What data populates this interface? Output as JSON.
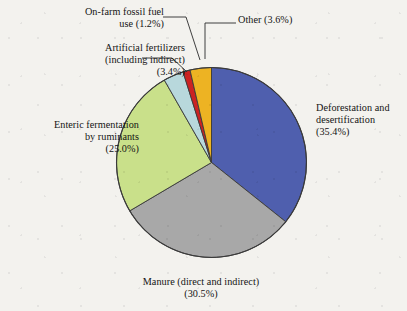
{
  "chart_data": {
    "type": "pie",
    "title": "",
    "subtitle": "",
    "xlabel": "",
    "ylabel": "",
    "units": "percent",
    "legend_position": "none",
    "grid": false,
    "start_angle_deg": 0,
    "direction": "clockwise",
    "categories": [
      "Deforestation and desertification",
      "Manure (direct and indirect)",
      "Enteric fermentation by ruminants",
      "Artificial fertilizers (including indirect)",
      "On-farm fossil fuel use",
      "Other"
    ],
    "values": [
      35.4,
      30.5,
      25.0,
      3.4,
      1.2,
      3.6
    ],
    "colors": [
      "#4f5fae",
      "#a8a8a8",
      "#c9e08a",
      "#b8d8dc",
      "#cc2222",
      "#edb323"
    ],
    "slices": [
      {
        "name": "deforestation",
        "label": "Deforestation and desertification",
        "value": 35.4,
        "value_text": "(35.4%)",
        "color": "#4f5fae"
      },
      {
        "name": "manure",
        "label": "Manure (direct and indirect)",
        "value": 30.5,
        "value_text": "(30.5%)",
        "color": "#a8a8a8"
      },
      {
        "name": "enteric-fermentation",
        "label": "Enteric fermentation by ruminants",
        "value": 25.0,
        "value_text": "(25.0%)",
        "color": "#c9e08a"
      },
      {
        "name": "artificial-fertilizers",
        "label": "Artificial fertilizers (including indirect)",
        "value": 3.4,
        "value_text": "(3.4%)",
        "color": "#b8d8dc"
      },
      {
        "name": "on-farm-fossil-fuel",
        "label": "On-farm fossil fuel use",
        "value": 1.2,
        "value_text": "(1.2%)",
        "color": "#cc2222"
      },
      {
        "name": "other",
        "label": "Other",
        "value": 3.6,
        "value_text": "(3.6%)",
        "color": "#edb323"
      }
    ]
  },
  "labels": {
    "fossil_fuel": "On-farm fossil fuel\nuse (1.2%)",
    "fertilizers": "Artificial fertilizers\n(including indirect)\n(3.4%)",
    "enteric": "Enteric fermentation\nby ruminants\n(25.0%)",
    "deforestation": "Deforestation and\ndesertification\n(35.4%)",
    "manure": "Manure (direct and indirect)\n(30.5%)",
    "other": "Other (3.6%)"
  },
  "style": {
    "background": "#f3f2ee",
    "outline": "#3a3a3a",
    "leader_line": "#2b2b2b",
    "text": "#141414"
  }
}
